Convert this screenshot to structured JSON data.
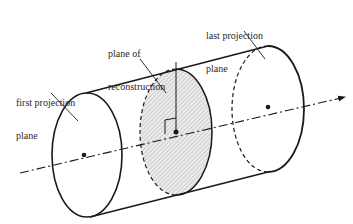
{
  "diagram": {
    "type": "cylinder-projection-planes",
    "colors": {
      "stroke": "#1a1a1a",
      "hatch_fill": "#d9d9d9",
      "text": "#2a2a2a",
      "background": "#ffffff"
    },
    "labels": {
      "first_projection_plane": {
        "line1": "first projection",
        "line2": "plane"
      },
      "plane_of_reconstruction": {
        "line1": "plane of",
        "line2": "reconstruction"
      },
      "last_projection_plane": {
        "line1": "last projection",
        "line2": "plane"
      }
    },
    "elements": [
      {
        "id": "first-projection-plane",
        "shape": "ellipse",
        "style": "solid"
      },
      {
        "id": "plane-of-reconstruction",
        "shape": "ellipse",
        "style": "hatched, left half dashed"
      },
      {
        "id": "last-projection-plane",
        "shape": "ellipse",
        "style": "right half solid, left half dashed"
      },
      {
        "id": "rotation-axis",
        "shape": "dash-dot arrow"
      },
      {
        "id": "perpendicular-marker",
        "shape": "right-angle"
      }
    ]
  }
}
